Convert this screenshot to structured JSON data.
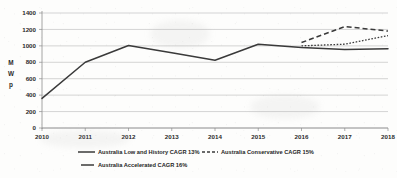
{
  "chart_data": {
    "type": "line",
    "title": "",
    "xlabel": "",
    "ylabel": "MWp",
    "ylabel_chars": [
      "M",
      "W",
      "p"
    ],
    "x": [
      2010,
      2011,
      2012,
      2013,
      2014,
      2015,
      2016,
      2017,
      2018
    ],
    "xtick_labels": [
      "2010",
      "2011",
      "2012",
      "2013",
      "2014",
      "2015",
      "2016",
      "2017",
      "2018"
    ],
    "ytick_labels": [
      "0",
      "200",
      "400",
      "600",
      "800",
      "1000",
      "1200",
      "1400"
    ],
    "yticks": [
      0,
      200,
      400,
      600,
      800,
      1000,
      1200,
      1400
    ],
    "ylim": [
      0,
      1400
    ],
    "xlim": [
      2010,
      2018
    ],
    "grid": true,
    "grid_axis": "y",
    "legend_position": "bottom",
    "series": [
      {
        "name": "Australia Low and History CAGR 13%",
        "style": "solid",
        "color": "#3a3a3a",
        "x": [
          2010,
          2011,
          2012,
          2013,
          2014,
          2015,
          2016,
          2017,
          2018
        ],
        "values": [
          360,
          800,
          1005,
          915,
          825,
          1020,
          980,
          955,
          965
        ]
      },
      {
        "name": "Australia Conservative CAGR 15%",
        "style": "dotted",
        "color": "#3a3a3a",
        "x": [
          2016,
          2017,
          2018
        ],
        "values": [
          1000,
          1020,
          1125
        ]
      },
      {
        "name": "Australia Accelerated CAGR 16%",
        "style": "dashed",
        "color": "#3a3a3a",
        "x": [
          2016,
          2017,
          2018
        ],
        "values": [
          1040,
          1235,
          1180
        ]
      }
    ]
  },
  "legend": {
    "items": [
      {
        "label": "Australia Low and History CAGR 13%",
        "style": "solid"
      },
      {
        "label": "Australia Conservative CAGR 15%",
        "style": "dotted"
      },
      {
        "label": "Australia Accelerated CAGR 16%",
        "style": "solid"
      }
    ]
  },
  "colors": {
    "line": "#3a3a3a",
    "gridline": "#b9b9b9",
    "axis": "#8e8e8e",
    "text": "#2b2b2b",
    "background": "#fdfdfc"
  }
}
